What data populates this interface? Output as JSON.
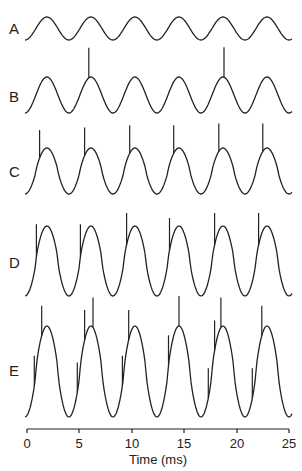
{
  "chart_data": {
    "type": "line",
    "title": "",
    "xlabel": "Time (ms)",
    "ylabel": "",
    "xlim": [
      0,
      25
    ],
    "x_ticks": [
      0,
      5,
      10,
      15,
      20,
      25
    ],
    "grid": false,
    "legend": null,
    "period_ms": 4.2,
    "series": [
      {
        "name": "A",
        "amplitude": "small",
        "spike_times_ms": []
      },
      {
        "name": "B",
        "amplitude": "medium",
        "spike_times_ms": [
          5.9,
          18.8
        ]
      },
      {
        "name": "C",
        "amplitude": "medium-large",
        "spike_times_ms": [
          1.2,
          5.5,
          9.8,
          14.0,
          18.3,
          22.5
        ]
      },
      {
        "name": "D",
        "amplitude": "large",
        "spike_times_ms": [
          0.9,
          5.1,
          9.5,
          13.6,
          17.9,
          22.1
        ]
      },
      {
        "name": "E",
        "amplitude": "largest",
        "spike_times_ms": [
          0.7,
          1.4,
          4.8,
          5.5,
          6.3,
          9.1,
          9.7,
          13.5,
          14.5,
          17.3,
          17.9,
          18.5,
          21.5,
          22.4
        ]
      }
    ]
  },
  "labels": {
    "A": "A",
    "B": "B",
    "C": "C",
    "D": "D",
    "E": "E"
  },
  "axis": {
    "ticks": [
      "0",
      "5",
      "10",
      "15",
      "20",
      "25"
    ],
    "xlabel": "Time (ms)"
  }
}
